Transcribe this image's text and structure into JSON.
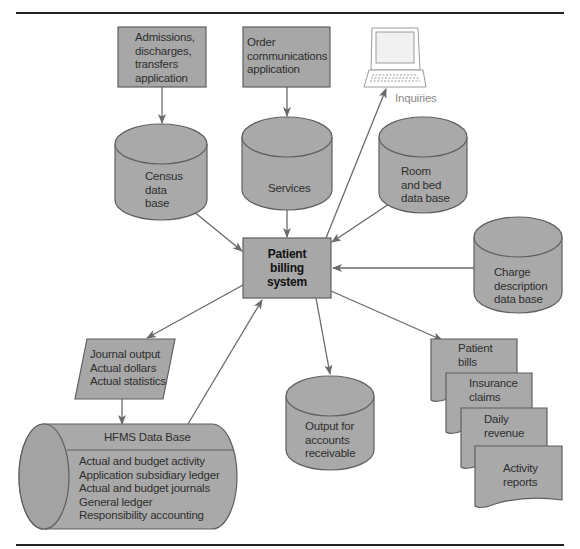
{
  "colors": {
    "fill": "#a9a9a9",
    "fill_dark": "#9a9a9a",
    "stroke": "#5f5f5f",
    "arrow": "#6a6a6a",
    "rule": "#222222",
    "text": "#2e2e2e"
  },
  "nodes": {
    "admissions": {
      "lines": [
        "Admissions,",
        "discharges,",
        "transfers",
        "application"
      ],
      "shape": "rectangle"
    },
    "order_comm": {
      "lines": [
        "Order",
        "communications",
        "application"
      ],
      "shape": "rectangle"
    },
    "terminal": {
      "label": "Inquiries",
      "shape": "computer-terminal"
    },
    "census_db": {
      "lines": [
        "Census",
        "data",
        "base"
      ],
      "shape": "cylinder"
    },
    "services_db": {
      "lines": [
        "Services"
      ],
      "shape": "cylinder"
    },
    "room_bed_db": {
      "lines": [
        "Room",
        "and bed",
        "data base"
      ],
      "shape": "cylinder"
    },
    "patient_billing": {
      "lines": [
        "Patient",
        "billing",
        "system"
      ],
      "shape": "rectangle"
    },
    "charge_desc_db": {
      "lines": [
        "Charge",
        "description",
        "data base"
      ],
      "shape": "cylinder"
    },
    "journal_output": {
      "lines": [
        "Journal output",
        "Actual dollars",
        "Actual statistics"
      ],
      "shape": "parallelogram"
    },
    "ar_output_db": {
      "lines": [
        "Output for",
        "accounts",
        "receivable"
      ],
      "shape": "cylinder"
    },
    "hfms_db": {
      "title": "HFMS Data Base",
      "lines": [
        "Actual and budget activity",
        "Application subsidiary ledger",
        "Actual and budget journals",
        "General ledger",
        "Responsibility accounting"
      ],
      "shape": "horizontal-cylinder"
    },
    "documents": [
      {
        "lines": [
          "Patient",
          "bills"
        ]
      },
      {
        "lines": [
          "Insurance",
          "claims"
        ]
      },
      {
        "lines": [
          "Daily",
          "revenue"
        ]
      },
      {
        "lines": [
          "Activity",
          "reports"
        ]
      }
    ]
  },
  "edges": [
    {
      "from": "admissions",
      "to": "census_db"
    },
    {
      "from": "order_comm",
      "to": "services_db"
    },
    {
      "from": "census_db",
      "to": "patient_billing"
    },
    {
      "from": "services_db",
      "to": "patient_billing"
    },
    {
      "from": "room_bed_db",
      "to": "patient_billing"
    },
    {
      "from": "charge_desc_db",
      "to": "patient_billing"
    },
    {
      "from": "patient_billing",
      "to": "terminal"
    },
    {
      "from": "patient_billing",
      "to": "journal_output"
    },
    {
      "from": "patient_billing",
      "to": "ar_output_db"
    },
    {
      "from": "patient_billing",
      "to": "documents"
    },
    {
      "from": "journal_output",
      "to": "hfms_db"
    },
    {
      "from": "hfms_db",
      "to": "patient_billing"
    }
  ]
}
